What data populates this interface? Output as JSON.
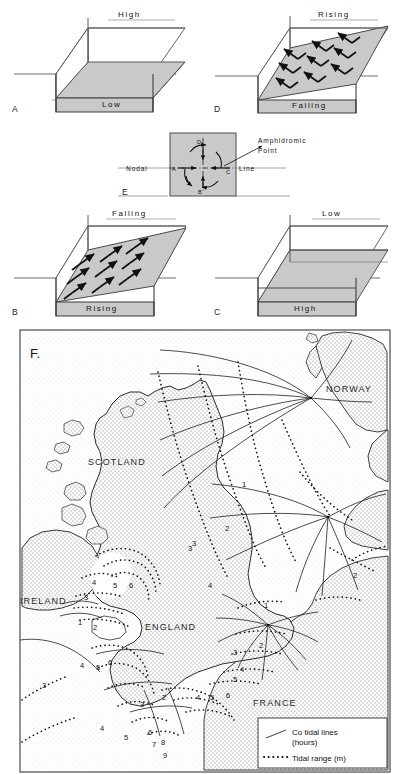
{
  "figure": {
    "panels": [
      {
        "id": "A",
        "letter": "A",
        "top_label": "High",
        "bottom_label": "Low",
        "arrows": false,
        "description": "standing wave at high water one end, low water other end"
      },
      {
        "id": "B",
        "letter": "B",
        "top_label": "Falling",
        "bottom_label": "Rising",
        "arrows": true,
        "arrow_direction": "up-right",
        "description": "mid tide, water flowing toward rising end"
      },
      {
        "id": "C",
        "letter": "C",
        "top_label": "Low",
        "bottom_label": "High",
        "arrows": false,
        "description": "standing wave reversed, low water one end high water other"
      },
      {
        "id": "D",
        "letter": "D",
        "top_label": "Rising",
        "bottom_label": "Falling",
        "arrows": true,
        "arrow_direction": "up-left",
        "description": "mid tide, flow reversed"
      },
      {
        "id": "E",
        "letter": "E",
        "description": "amphidromic point plan view with rotating tidal wave"
      },
      {
        "id": "F",
        "letter": "F.",
        "description": "co-tidal map of British Isles and North Sea"
      }
    ],
    "panel_e": {
      "label_nodal": "Nodal",
      "label_line": "Line",
      "label_amphidromic": "Amphidromic",
      "label_point": "Point",
      "points": [
        "A",
        "B",
        "C",
        "D"
      ],
      "rotation": "anticlockwise"
    },
    "map": {
      "letter": "F.",
      "countries": [
        "NORWAY",
        "SCOTLAND",
        "IRELAND",
        "ENGLAND",
        "FRANCE"
      ],
      "legend": {
        "cotidal_label": "Co tidal  lines",
        "cotidal_units": "(hours)",
        "range_label": "Tidal  range (m)"
      },
      "cotidal_labels": [
        "1",
        "2",
        "3",
        "1",
        "2",
        "2"
      ],
      "tidal_range_labels": [
        "3",
        "4",
        "5",
        "6",
        "1",
        "2",
        "3",
        "4",
        "5",
        "6",
        "3",
        "4",
        "5",
        "6",
        "7",
        "8",
        "9",
        "1",
        "2",
        "3",
        "4",
        "5",
        "4",
        "5",
        "6"
      ],
      "amphidromic_points": [
        {
          "name": "north-sea-norway",
          "x": 311,
          "y": 398
        },
        {
          "name": "german-bight",
          "x": 328,
          "y": 517
        },
        {
          "name": "southern-bight",
          "x": 268,
          "y": 625
        }
      ]
    }
  }
}
